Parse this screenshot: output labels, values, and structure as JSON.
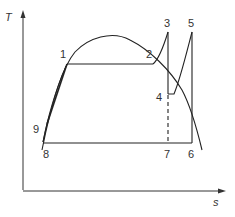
{
  "diagram": {
    "type": "T-s diagram (reheat Rankine cycle)",
    "axes": {
      "y_label": "T",
      "x_label": "s"
    },
    "points": [
      {
        "id": "1",
        "label": "1"
      },
      {
        "id": "2",
        "label": "2"
      },
      {
        "id": "3",
        "label": "3"
      },
      {
        "id": "4",
        "label": "4"
      },
      {
        "id": "5",
        "label": "5"
      },
      {
        "id": "6",
        "label": "6"
      },
      {
        "id": "7",
        "label": "7"
      },
      {
        "id": "8",
        "label": "8"
      },
      {
        "id": "9",
        "label": "9"
      }
    ],
    "colors": {
      "line": "#222222",
      "background": "#ffffff"
    }
  }
}
